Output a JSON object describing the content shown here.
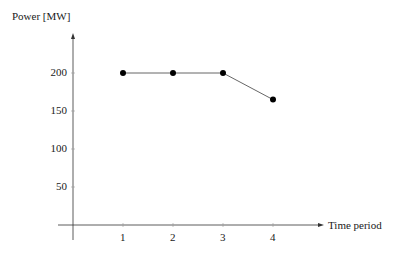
{
  "chart_data": {
    "type": "line",
    "title": "",
    "xlabel": "Time period",
    "ylabel": "Power [MW]",
    "categories": [
      1,
      2,
      3,
      4
    ],
    "x": [
      1,
      2,
      3,
      4
    ],
    "values": [
      200,
      200,
      200,
      165
    ],
    "series": [
      {
        "name": "Power",
        "values": [
          200,
          200,
          200,
          165
        ],
        "color": "#000000"
      }
    ],
    "xticks": [
      "1",
      "2",
      "3",
      "4"
    ],
    "yticks": [
      "50",
      "100",
      "150",
      "200"
    ],
    "ylim": [
      0,
      250
    ],
    "xlim": [
      0,
      5
    ],
    "grid": false,
    "legend": null
  },
  "axes": {
    "xlabel": "Time period",
    "ylabel": "Power [MW]",
    "xticks": [
      "1",
      "2",
      "3",
      "4"
    ],
    "yticks": [
      "200",
      "150",
      "100",
      "50"
    ]
  },
  "colors": {
    "line": "#555555",
    "marker": "#000000",
    "axis": "#333333"
  }
}
